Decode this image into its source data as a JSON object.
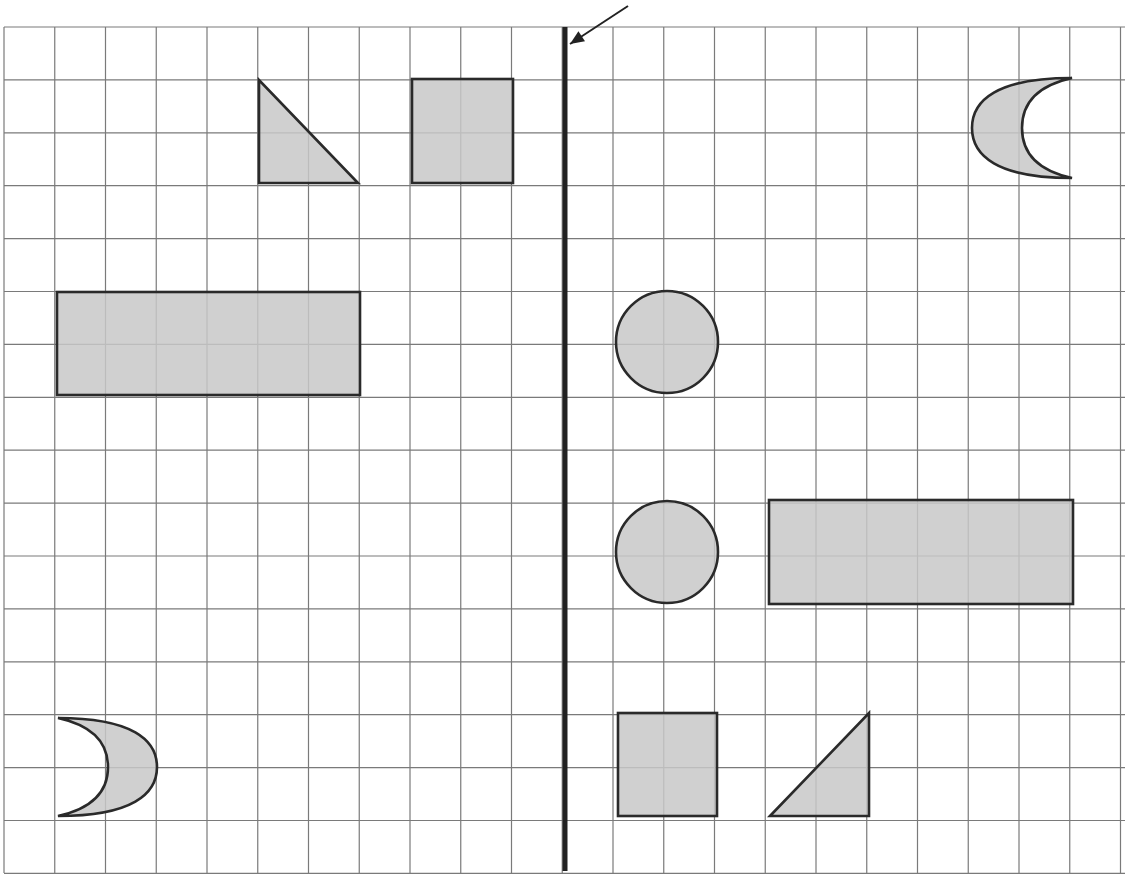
{
  "diagram": {
    "colors": {
      "background": "#ffffff",
      "grid_line": "#7a7a7a",
      "shape_fill": "#c8c8c8",
      "shape_stroke": "#2a2a2a",
      "mirror_line": "#222222",
      "arrow": "#222222"
    },
    "grid": {
      "left": 4,
      "top": 27,
      "right": 1125,
      "bottom": 873,
      "col_width": 50.75,
      "row_height": 52.9,
      "columns": 22,
      "rows": 16
    },
    "mirror_line": {
      "x": 565,
      "y1": 27,
      "y2": 871,
      "width": 5
    },
    "arrow": {
      "from": [
        628,
        6
      ],
      "to": [
        570,
        44
      ],
      "points_to": "mirror-line"
    },
    "shapes": [
      {
        "id": "left-triangle",
        "type": "triangle",
        "side": "left",
        "points": [
          [
            259,
            80
          ],
          [
            259,
            183
          ],
          [
            358,
            183
          ]
        ]
      },
      {
        "id": "left-square",
        "type": "square",
        "side": "left",
        "x": 412,
        "y": 79,
        "w": 101,
        "h": 104
      },
      {
        "id": "left-rectangle",
        "type": "rectangle",
        "side": "left",
        "x": 57,
        "y": 292,
        "w": 303,
        "h": 103
      },
      {
        "id": "left-crescent",
        "type": "crescent",
        "side": "left",
        "tip_top": [
          58,
          718
        ],
        "tip_bottom": [
          58,
          816
        ],
        "outer_x": 157,
        "inner_x": 108,
        "mid_y": 767
      },
      {
        "id": "right-crescent",
        "type": "crescent",
        "side": "right",
        "tip_top": [
          1072,
          78
        ],
        "tip_bottom": [
          1072,
          178
        ],
        "outer_x": 972,
        "inner_x": 1022,
        "mid_y": 128
      },
      {
        "id": "right-circle-top",
        "type": "circle",
        "side": "right",
        "cx": 667,
        "cy": 342,
        "r": 51
      },
      {
        "id": "right-circle-bottom",
        "type": "circle",
        "side": "right",
        "cx": 667,
        "cy": 552,
        "r": 51
      },
      {
        "id": "right-rectangle",
        "type": "rectangle",
        "side": "right",
        "x": 769,
        "y": 500,
        "w": 304,
        "h": 104
      },
      {
        "id": "right-square",
        "type": "square",
        "side": "right",
        "x": 618,
        "y": 713,
        "w": 99,
        "h": 103
      },
      {
        "id": "right-triangle",
        "type": "triangle",
        "side": "right",
        "points": [
          [
            770,
            816
          ],
          [
            869,
            713
          ],
          [
            869,
            816
          ]
        ]
      }
    ]
  }
}
